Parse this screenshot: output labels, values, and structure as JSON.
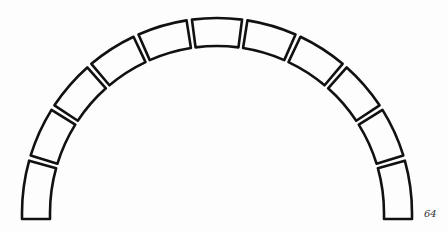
{
  "figure": {
    "number_label": "64",
    "stroke_color": "#111111",
    "background_color": "#fdfdfd"
  },
  "arch": {
    "voussoir_count": 11,
    "center": [
      217,
      213
    ],
    "outer_radius": 195,
    "inner_radius": 167,
    "gap_degrees": 1.6,
    "spring_extension": 6
  }
}
